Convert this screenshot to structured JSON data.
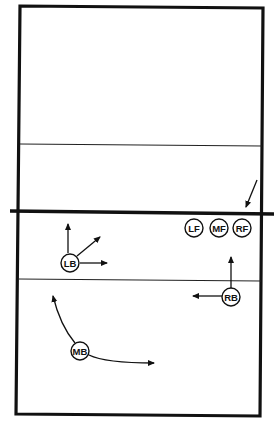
{
  "diagram": {
    "type": "volleyball-court-rotation",
    "colors": {
      "line": "#111111",
      "background": "#ffffff"
    },
    "court": {
      "corners": {
        "tl": [
          20,
          6
        ],
        "tr": [
          263,
          8
        ],
        "br": [
          260,
          416
        ],
        "bl": [
          16,
          414
        ]
      },
      "net": {
        "x1": 10,
        "y1": 211,
        "x2": 274,
        "y2": 214
      },
      "attack_line_top": {
        "x1": 20,
        "y1": 144,
        "x2": 262,
        "y2": 146
      },
      "attack_line_bottom": {
        "x1": 18,
        "y1": 279,
        "x2": 261,
        "y2": 281
      }
    },
    "players": [
      {
        "id": "lf",
        "label": "LF",
        "x": 194,
        "y": 228
      },
      {
        "id": "mf",
        "label": "MF",
        "x": 219,
        "y": 228
      },
      {
        "id": "rf",
        "label": "RF",
        "x": 242,
        "y": 228
      },
      {
        "id": "lb",
        "label": "LB",
        "x": 70,
        "y": 263
      },
      {
        "id": "rb",
        "label": "RB",
        "x": 231,
        "y": 297
      },
      {
        "id": "mb",
        "label": "MB",
        "x": 80,
        "y": 351
      }
    ],
    "arrows": [
      {
        "id": "ball-arrow",
        "from": [
          257,
          180
        ],
        "to": [
          246,
          207
        ]
      },
      {
        "id": "lb-up",
        "from": [
          68,
          253
        ],
        "to": [
          68,
          224
        ]
      },
      {
        "id": "lb-diag",
        "from": [
          77,
          256
        ],
        "to": [
          100,
          237
        ]
      },
      {
        "id": "lb-right",
        "from": [
          80,
          263
        ],
        "to": [
          107,
          263
        ]
      },
      {
        "id": "rb-up",
        "from": [
          231,
          288
        ],
        "to": [
          231,
          257
        ]
      },
      {
        "id": "rb-left",
        "from": [
          222,
          296
        ],
        "to": [
          193,
          296
        ]
      }
    ],
    "curves": [
      {
        "id": "mb-curve-up",
        "d": "M 75 343 Q 60 325 53 296"
      },
      {
        "id": "mb-curve-right",
        "d": "M 89 355 Q 105 363 154 363"
      }
    ]
  }
}
